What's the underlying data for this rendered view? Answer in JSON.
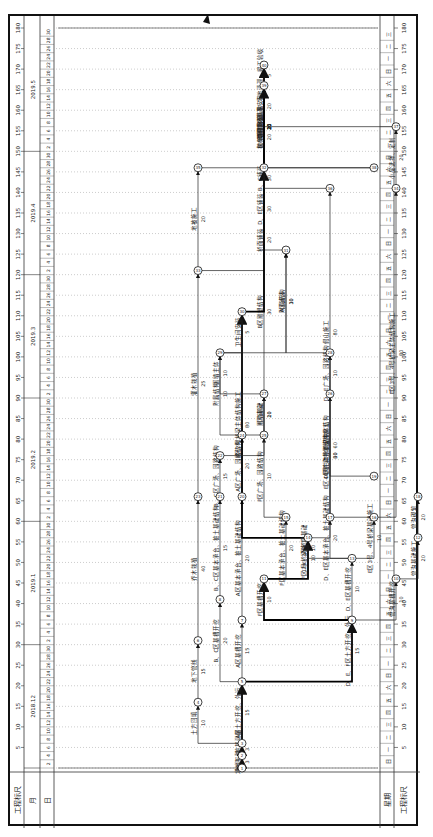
{
  "axis": {
    "scale_label": "工程标尺",
    "month_label": "月",
    "day_label": "日",
    "week_label": "星期",
    "scale_ticks": [
      5,
      10,
      15,
      20,
      25,
      30,
      35,
      40,
      45,
      50,
      55,
      60,
      65,
      70,
      75,
      80,
      85,
      90,
      95,
      100,
      105,
      110,
      115,
      120,
      125,
      130,
      135,
      140,
      145,
      150,
      155,
      160,
      165,
      170,
      175,
      180
    ],
    "months": [
      {
        "label": "2018.12",
        "start": 0,
        "end": 30
      },
      {
        "label": "2019.1",
        "start": 30,
        "end": 60
      },
      {
        "label": "2019.2",
        "start": 60,
        "end": 90
      },
      {
        "label": "2019.3",
        "start": 90,
        "end": 120
      },
      {
        "label": "2019.4",
        "start": 120,
        "end": 150
      },
      {
        "label": "2019.5",
        "start": 150,
        "end": 180
      }
    ],
    "days": [
      "2",
      "4",
      "6",
      "8",
      "10",
      "12",
      "14",
      "16",
      "18",
      "20",
      "22",
      "24",
      "26",
      "28",
      "30"
    ],
    "weekdays": [
      "日",
      "一",
      "二",
      "三",
      "四",
      "五",
      "六"
    ],
    "total_days": 180
  },
  "nodes": [
    {
      "id": "1",
      "t": 0,
      "lane": 0
    },
    {
      "id": "2",
      "t": 3,
      "lane": 0
    },
    {
      "id": "3",
      "t": 6,
      "lane": 0
    },
    {
      "id": "4",
      "t": 16,
      "lane": 2
    },
    {
      "id": "5",
      "t": 21,
      "lane": 0
    },
    {
      "id": "6",
      "t": 31,
      "lane": 2
    },
    {
      "id": "7",
      "t": 36,
      "lane": 0
    },
    {
      "id": "8",
      "t": 41,
      "lane": 1
    },
    {
      "id": "9",
      "t": 36,
      "lane": -5
    },
    {
      "id": "10",
      "t": 46,
      "lane": -7
    },
    {
      "id": "11",
      "t": 46,
      "lane": -1
    },
    {
      "id": "12",
      "t": 56,
      "lane": -8
    },
    {
      "id": "13",
      "t": 51,
      "lane": -5
    },
    {
      "id": "14",
      "t": 56,
      "lane": -3
    },
    {
      "id": "15",
      "t": 61,
      "lane": -2
    },
    {
      "id": "16",
      "t": 61,
      "lane": -6
    },
    {
      "id": "17",
      "t": 61,
      "lane": -4
    },
    {
      "id": "18",
      "t": 66,
      "lane": -8
    },
    {
      "id": "19",
      "t": 71,
      "lane": -6
    },
    {
      "id": "20",
      "t": 66,
      "lane": 0
    },
    {
      "id": "21",
      "t": 66,
      "lane": 1
    },
    {
      "id": "22",
      "t": 76,
      "lane": 1
    },
    {
      "id": "23",
      "t": 66,
      "lane": 2
    },
    {
      "id": "24",
      "t": 81,
      "lane": 0
    },
    {
      "id": "25",
      "t": 81,
      "lane": -1
    },
    {
      "id": "26",
      "t": 91,
      "lane": -4
    },
    {
      "id": "27",
      "t": 91,
      "lane": -1
    },
    {
      "id": "28",
      "t": 101,
      "lane": -4
    },
    {
      "id": "29",
      "t": 101,
      "lane": 1
    },
    {
      "id": "30",
      "t": 111,
      "lane": 0
    },
    {
      "id": "31",
      "t": 126,
      "lane": -2
    },
    {
      "id": "32",
      "t": 146,
      "lane": -1
    },
    {
      "id": "33",
      "t": 121,
      "lane": 2
    },
    {
      "id": "34",
      "t": 141,
      "lane": -7
    },
    {
      "id": "35",
      "t": 146,
      "lane": 2
    },
    {
      "id": "36",
      "t": 141,
      "lane": -4
    },
    {
      "id": "37",
      "t": 156,
      "lane": -7
    },
    {
      "id": "38",
      "t": 146,
      "lane": -6
    },
    {
      "id": "39",
      "t": 166,
      "lane": -1
    },
    {
      "id": "40",
      "t": 171,
      "lane": -1
    }
  ],
  "activities": [
    {
      "label": "场地平整",
      "dur": "3",
      "from": "1",
      "to": "2",
      "critical": true
    },
    {
      "label": "抄测、桩基测量",
      "dur": "3",
      "from": "2",
      "to": "3",
      "critical": true
    },
    {
      "label": "A区土方开挖、外运",
      "dur": "15",
      "from": "3",
      "to": "5",
      "critical": true
    },
    {
      "label": "土方回填",
      "dur": "10",
      "from": "3",
      "to": "4"
    },
    {
      "label": "地下管线",
      "dur": "15",
      "from": "4",
      "to": "6"
    },
    {
      "label": "A区基槽开挖",
      "dur": "15",
      "from": "5",
      "to": "7"
    },
    {
      "label": "B、C区基槽开挖",
      "dur": "20",
      "from": "5",
      "to": "8"
    },
    {
      "label": "D、E、F区土方开挖、外运",
      "dur": "15",
      "from": "5",
      "to": "9",
      "critical": true
    },
    {
      "label": "F区基槽开挖",
      "dur": "10",
      "from": "9",
      "to": "11",
      "critical": true
    },
    {
      "label": "D、E区基槽开挖",
      "dur": "10",
      "from": "9",
      "to": "13"
    },
    {
      "label": "管沟基槽开挖",
      "dur": "10",
      "from": "9",
      "to": "10"
    },
    {
      "label": "管沟基础施工",
      "dur": "20",
      "from": "10",
      "to": "12"
    },
    {
      "label": "管沟砌筑",
      "dur": "20",
      "from": "12",
      "to": "18"
    },
    {
      "label": "A区基本承台、桩土基础结构",
      "dur": "20",
      "from": "7",
      "to": "20"
    },
    {
      "label": "B、C区基本承台、桩土基础结构",
      "dur": "15",
      "from": "8",
      "to": "21"
    },
    {
      "label": "A区广场、园路结构",
      "dur": "20",
      "from": "20",
      "to": "24"
    },
    {
      "label": "B、C区广场、园路结构",
      "dur": "15",
      "from": "21",
      "to": "22"
    },
    {
      "label": "乔木栽植",
      "dur": "40",
      "from": "6",
      "to": "23"
    },
    {
      "label": "灌木栽植",
      "dur": "25",
      "from": "23",
      "to": "33"
    },
    {
      "label": "地被施工",
      "dur": "20",
      "from": "33",
      "to": "35"
    },
    {
      "label": "草坪施工",
      "dur": "20",
      "from": "35",
      "to": "39"
    },
    {
      "label": "F区基本承台、桩土基础结构",
      "dur": "20",
      "from": "11",
      "to": "15"
    },
    {
      "label": "F区广场、园路结构",
      "dur": "10",
      "from": "15",
      "to": "25"
    },
    {
      "label": "F区2#桥梁施工",
      "dur": "10",
      "from": "11",
      "to": "14",
      "critical": true
    },
    {
      "label": "F区2号桥梁主体结构施工",
      "dur": "80",
      "from": "14",
      "to": "30",
      "critical": true
    },
    {
      "label": "D、E区基本承台、桩土基础结构",
      "dur": "20",
      "from": "13",
      "to": "17"
    },
    {
      "label": "1号、2号桥梁基础",
      "dur": "10",
      "from": "13",
      "to": "14"
    },
    {
      "label": "1号、2号桥梁主体结构",
      "dur": "60",
      "from": "14",
      "to": "28"
    },
    {
      "label": "E区3号、4号桥梁基础施工",
      "dur": "10",
      "from": "13",
      "to": "16"
    },
    {
      "label": "E区3号、4号桥梁主体结构施工",
      "dur": "80",
      "from": "16",
      "to": "34"
    },
    {
      "label": "E区4号桥梁主体结构施工",
      "dur": "60",
      "from": "16",
      "to": "26"
    },
    {
      "label": "D区主体水景结构",
      "dur": "30",
      "from": "17",
      "to": "26"
    },
    {
      "label": "D、E广场、园路结构",
      "dur": "10",
      "from": "26",
      "to": "28"
    },
    {
      "label": "附属结构",
      "dur": "10",
      "from": "28",
      "to": "31"
    },
    {
      "label": "D、E区铺装",
      "dur": "30",
      "from": "31",
      "to": "32"
    },
    {
      "label": "假山施工",
      "dur": "80",
      "from": "19",
      "to": "36"
    },
    {
      "label": "F区铺装",
      "dur": "20",
      "from": "25",
      "to": "27"
    },
    {
      "label": "围墙基础",
      "dur": "10",
      "from": "24",
      "to": "27"
    },
    {
      "label": "附属结构",
      "dur": "10",
      "from": "24",
      "to": "29"
    },
    {
      "label": "围墙主体",
      "dur": "10",
      "from": "27",
      "to": "29"
    },
    {
      "label": "卫生间安装",
      "dur": "5",
      "from": "29",
      "to": "30"
    },
    {
      "label": "A区铺装",
      "dur": "30",
      "from": "29",
      "to": "31"
    },
    {
      "label": "B区雕塑结构",
      "dur": "30",
      "from": "22",
      "to": "32"
    },
    {
      "label": "B、C区广场结构",
      "dur": "25",
      "from": "32",
      "to": "39"
    },
    {
      "label": "B、C铺装",
      "dur": "30",
      "from": "33",
      "to": "39"
    },
    {
      "label": "桥面铺装",
      "dur": "20",
      "from": "30",
      "to": "32",
      "critical": true
    },
    {
      "label": "栏杆施工",
      "dur": "20",
      "from": "36",
      "to": "39"
    },
    {
      "label": "小品选择、定制",
      "dur": "20",
      "from": "34",
      "to": "37"
    },
    {
      "label": "小品安装",
      "dur": "20",
      "from": "37",
      "to": "39"
    },
    {
      "label": "电缆敷设",
      "dur": "10",
      "from": "38",
      "to": "39"
    },
    {
      "label": "灯具安装",
      "dur": "10",
      "from": "38",
      "to": "39"
    },
    {
      "label": "建筑物绿化清理",
      "dur": "20",
      "from": "32",
      "to": "39",
      "critical": true
    },
    {
      "label": "场地清理、竣工验收",
      "dur": "5",
      "from": "39",
      "to": "40",
      "critical": true
    }
  ],
  "colors": {
    "line": "#222222",
    "critical": "#000000",
    "grid": "#9a9a9a",
    "frame": "#111111"
  }
}
